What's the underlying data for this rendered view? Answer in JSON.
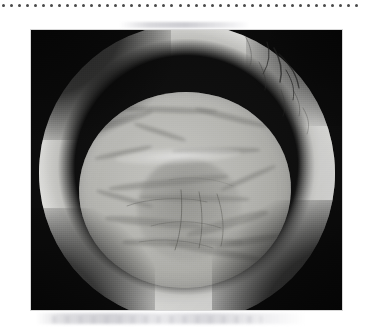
{
  "page": {
    "background_color": "#ffffff",
    "width": 365,
    "height": 330,
    "content_type": "scanned-figure"
  },
  "separator": {
    "name": "dotted-rule",
    "style": "dotted",
    "dot_color": "#4a4a4a",
    "dot_count": 45,
    "dot_spacing_px": 8,
    "dot_size_px": 3,
    "start_x": 2,
    "end_x": 355,
    "y": 6
  },
  "figure": {
    "name": "clinical-photograph",
    "caption": "",
    "label": "",
    "modality": "slit-lamp retroillumination photograph",
    "color_mode": "grayscale",
    "frame": {
      "x": 31,
      "y": 30,
      "width": 311,
      "height": 280
    },
    "border_color": "#d8d8d8",
    "background_color": "#0b0b0b",
    "regions": [
      {
        "name": "dark-surround",
        "description": "black non-illuminated field surrounding the globe",
        "tone": "#0a0a0a"
      },
      {
        "name": "outer-ring",
        "description": "bright white-gray annulus - iris margin and lens equator",
        "tone": "#f1f1ee"
      },
      {
        "name": "central-lens-disc",
        "description": "circular pupillary lens disc with cortical opacity",
        "tone": "#c6c6c1"
      },
      {
        "name": "capsule-margin-arc",
        "description": "darker arc along the inferior lens capsule edge",
        "tone": "#3a3a38"
      },
      {
        "name": "specular-highlight",
        "description": "bright horizontal light streak across mid lens",
        "tone": "#ffffff"
      },
      {
        "name": "nuclear-plaque",
        "description": "denser central-inferior opacity / posterior plaque",
        "tone": "#8c8c88"
      },
      {
        "name": "vessel-streaks",
        "description": "fine dark linear streaks in the superotemporal quadrant",
        "tone": "#3c3c3a"
      }
    ]
  },
  "artifacts": {
    "top_band": {
      "name": "scan-band-top",
      "description": "faint gray offset ink band above the photograph",
      "tone": "#c8c8ce"
    },
    "bottom_band": {
      "name": "scan-band-bottom",
      "description": "faint gray offset ink smudge below the photograph",
      "tone": "#c6c6cc"
    }
  }
}
